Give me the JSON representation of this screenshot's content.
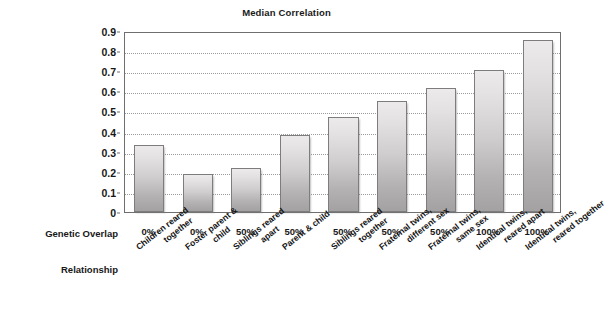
{
  "chart_data": {
    "type": "bar",
    "title": "Median Correlation",
    "xlabel": "",
    "ylabel": "",
    "ylim": [
      0,
      0.9
    ],
    "grid": true,
    "legend": "none",
    "ytick_labels": [
      "0.9",
      "0.8",
      "0.7",
      "0.6",
      "0.5",
      "0.4",
      "0.3",
      "0.2",
      "0.1",
      "0"
    ],
    "ytick_values": [
      0.9,
      0.8,
      0.7,
      0.6,
      0.5,
      0.4,
      0.3,
      0.2,
      0.1,
      0
    ],
    "categories": [
      "Children reared together",
      "Foster parent & child",
      "Siblings reared apart",
      "Parent & child",
      "Siblings reared together",
      "Fraternal twins, different sex",
      "Fraternal twins, same sex",
      "Identical twins, reared apart",
      "Identical twins, reared together"
    ],
    "values": [
      0.335,
      0.19,
      0.22,
      0.385,
      0.47,
      0.55,
      0.615,
      0.705,
      0.855
    ],
    "genetic_overlap": [
      "0%",
      "0%",
      "50%",
      "50%",
      "50%",
      "50%",
      "50%",
      "100%",
      "100%"
    ],
    "bar_color": "#cfcdcd",
    "bar_border_color": "#7d7d7d",
    "axis_color": "#6f6f6f",
    "gridline_color": "#9a9a9a"
  },
  "axis_rows": {
    "genetic_overlap_label": "Genetic Overlap",
    "relationship_label": "Relationship"
  },
  "relationship_lines": [
    [
      "Children reared",
      "together"
    ],
    [
      "Foster parent &",
      "child"
    ],
    [
      "Siblings reared",
      "apart"
    ],
    [
      "Parent & child",
      ""
    ],
    [
      "Siblings reared",
      "together"
    ],
    [
      "Fraternal twins,",
      "different sex"
    ],
    [
      "Fraternal twins,",
      "same sex"
    ],
    [
      "Identical twins,",
      "reared apart"
    ],
    [
      "Identical twins,",
      "reared together"
    ]
  ]
}
